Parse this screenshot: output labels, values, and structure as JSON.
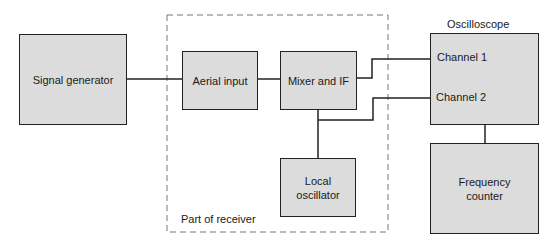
{
  "diagram": {
    "blocks": {
      "signal_generator": "Signal generator",
      "aerial_input": "Aerial input",
      "mixer_if": "Mixer and IF",
      "local_oscillator_line1": "Local",
      "local_oscillator_line2": "oscillator",
      "frequency_counter_line1": "Frequency",
      "frequency_counter_line2": "counter"
    },
    "oscilloscope": {
      "title": "Oscilloscope",
      "channel1": "Channel 1",
      "channel2": "Channel 2"
    },
    "receiver_group_label": "Part of receiver",
    "connections": [
      [
        "Signal generator",
        "Aerial input"
      ],
      [
        "Aerial input",
        "Mixer and IF"
      ],
      [
        "Mixer and IF",
        "Channel 1"
      ],
      [
        "Mixer and IF",
        "Local oscillator"
      ],
      [
        "Mixer and IF",
        "Channel 2"
      ],
      [
        "Oscilloscope",
        "Frequency counter"
      ]
    ]
  }
}
